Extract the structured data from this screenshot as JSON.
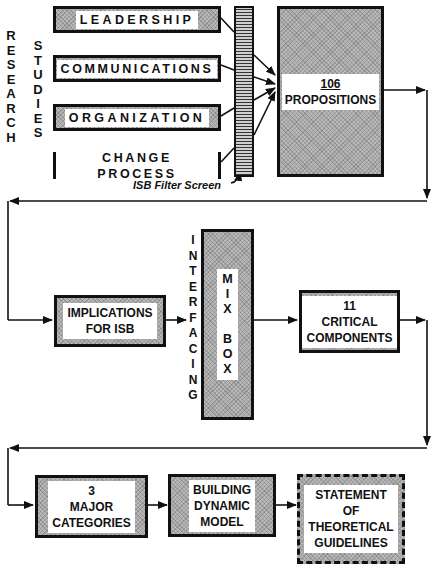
{
  "side_labels": {
    "research": "R\nE\nS\nE\nA\nR\nC\nH",
    "studies": "S\nT\nU\nD\nI\nE\nS",
    "interfacing": "I\nN\nT\nE\nR\nF\nA\nC\nI\nN\nG"
  },
  "research_areas": [
    "LEADERSHIP",
    "COMMUNICATIONS",
    "ORGANIZATION",
    "CHANGE PROCESS"
  ],
  "filter": {
    "caption": "ISB Filter Screen"
  },
  "propositions": {
    "number": "106",
    "label": "PROPOSITIONS"
  },
  "implications": {
    "label": "IMPLICATIONS\nFOR ISB"
  },
  "mix_box": {
    "label": "M\nI\nX\n\nB\nO\nX"
  },
  "critical": {
    "label": "11\nCRITICAL\nCOMPONENTS"
  },
  "categories": {
    "label": "3\nMAJOR\nCATEGORIES"
  },
  "model": {
    "label": "BUILDING\nDYNAMIC\nMODEL"
  },
  "statement": {
    "label": "STATEMENT\nOF\nTHEORETICAL\nGUIDELINES"
  }
}
